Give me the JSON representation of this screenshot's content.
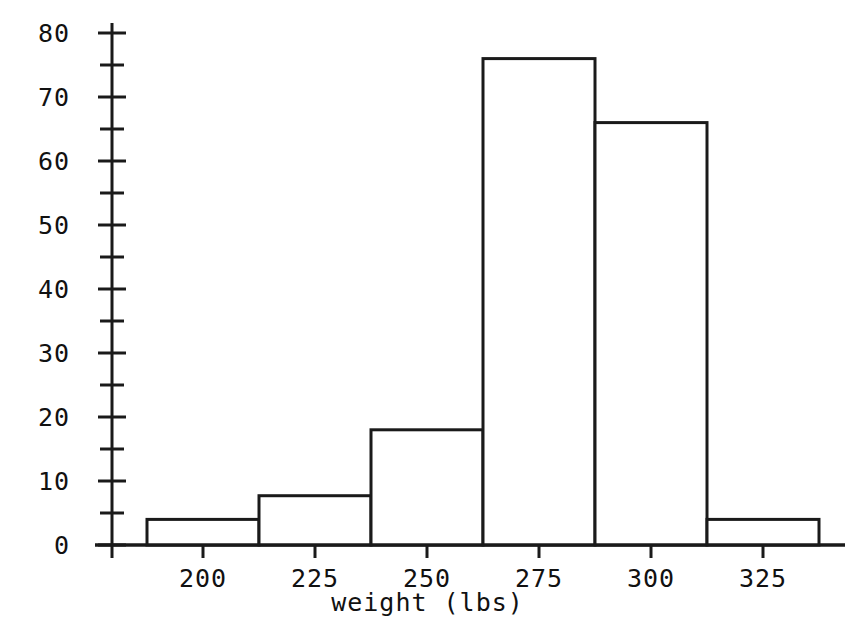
{
  "chart_data": {
    "type": "bar",
    "title": "",
    "subtitle": "",
    "xlabel": "weight (lbs)",
    "ylabel": "",
    "grid": false,
    "legend": false,
    "histogram": true,
    "bin_width": 25,
    "bin_edges": [
      187.5,
      212.5,
      237.5,
      262.5,
      287.5,
      312.5,
      337.5
    ],
    "categories": [
      "187.5-212.5",
      "212.5-237.5",
      "237.5-262.5",
      "262.5-287.5",
      "287.5-312.5",
      "312.5-337.5"
    ],
    "bin_centers": [
      200,
      225,
      250,
      275,
      300,
      325
    ],
    "values": [
      4,
      7.7,
      18,
      76,
      66,
      4
    ],
    "xlim": [
      180.5,
      343
    ],
    "ylim": [
      0,
      80
    ],
    "xticks": [
      200,
      225,
      250,
      275,
      300,
      325
    ],
    "xticklabels": [
      "200",
      "225",
      "250",
      "275",
      "300",
      "325"
    ],
    "yticks": [
      0,
      10,
      20,
      30,
      40,
      50,
      60,
      70,
      80
    ],
    "yticklabels": [
      "0",
      "10",
      "20",
      "30",
      "40",
      "50",
      "60",
      "70",
      "80"
    ],
    "yminorticks": [
      5,
      15,
      25,
      35,
      45,
      55,
      65,
      75
    ],
    "bar_fill": "#ffffff",
    "bar_edge_color": "#1a1a1a",
    "axis_color": "#1a1a1a",
    "background": "#ffffff"
  },
  "axes": {
    "x_title": "weight (lbs)",
    "y_title": ""
  }
}
